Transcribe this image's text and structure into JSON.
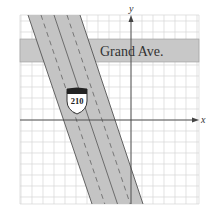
{
  "figure": {
    "axes": {
      "x_label": "x",
      "y_label": "y"
    },
    "grid": {
      "left": 20,
      "top": 15,
      "right": 199,
      "bottom": 204,
      "spacing": 11,
      "origin_px": [
        131,
        120
      ]
    },
    "road": {
      "label": "Grand Ave.",
      "top": 39,
      "bottom": 62
    },
    "highway": {
      "shield_number": "210",
      "top_left": 28,
      "top_right": 80,
      "bottom_left": 92,
      "bottom_right": 143
    },
    "colors": {
      "grid": "#d6d6d6",
      "road_fill": "#c8c8c8",
      "highway_fill": "#c4c4c4",
      "axis": "#444444",
      "edge": "#555555"
    }
  }
}
